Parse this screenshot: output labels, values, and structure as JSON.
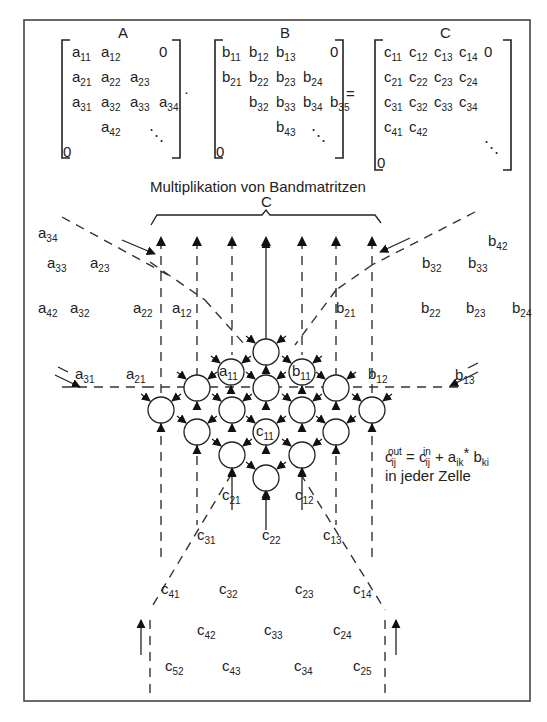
{
  "title": "Multiplikation von Bandmatritzen",
  "brace_label": "C",
  "operators": {
    "multiply": "·",
    "equals": "="
  },
  "matrices": {
    "A": {
      "name": "A",
      "rows": [
        [
          "a11",
          "a12",
          "",
          "0"
        ],
        [
          "a21",
          "a22",
          "a23",
          ""
        ],
        [
          "a31",
          "a32",
          "a33",
          "a34"
        ],
        [
          "",
          "a42",
          "",
          ""
        ]
      ],
      "zero": "0",
      "ellipsis": "⋱"
    },
    "B": {
      "name": "B",
      "rows": [
        [
          "b11",
          "b12",
          "b13",
          "",
          "0"
        ],
        [
          "b21",
          "b22",
          "b23",
          "b24",
          ""
        ],
        [
          "",
          "b32",
          "b33",
          "b34",
          "b35"
        ],
        [
          "",
          "",
          "b43",
          "",
          ""
        ]
      ],
      "zero": "0",
      "ellipsis": "⋱"
    },
    "C": {
      "name": "C",
      "rows": [
        [
          "c11",
          "c12",
          "c13",
          "c14",
          "0"
        ],
        [
          "c21",
          "c22",
          "c23",
          "c24",
          ""
        ],
        [
          "c31",
          "c32",
          "c33",
          "c34",
          ""
        ],
        [
          "c41",
          "c42",
          "",
          "",
          ""
        ]
      ],
      "zero": "0",
      "ellipsis": "⋱"
    }
  },
  "a_inputs": [
    {
      "base": "a",
      "sub": "34"
    },
    {
      "base": "a",
      "sub": "33"
    },
    {
      "base": "a",
      "sub": "23"
    },
    {
      "base": "a",
      "sub": "42"
    },
    {
      "base": "a",
      "sub": "32"
    },
    {
      "base": "a",
      "sub": "22"
    },
    {
      "base": "a",
      "sub": "12"
    },
    {
      "base": "a",
      "sub": "31"
    },
    {
      "base": "a",
      "sub": "21"
    },
    {
      "base": "a",
      "sub": "11"
    }
  ],
  "b_inputs": [
    {
      "base": "b",
      "sub": "42"
    },
    {
      "base": "b",
      "sub": "32"
    },
    {
      "base": "b",
      "sub": "33"
    },
    {
      "base": "b",
      "sub": "21"
    },
    {
      "base": "b",
      "sub": "22"
    },
    {
      "base": "b",
      "sub": "23"
    },
    {
      "base": "b",
      "sub": "24"
    },
    {
      "base": "b",
      "sub": "13"
    },
    {
      "base": "b",
      "sub": "12"
    },
    {
      "base": "b",
      "sub": "11"
    }
  ],
  "c_values": [
    {
      "base": "c",
      "sub": "11"
    },
    {
      "base": "c",
      "sub": "21"
    },
    {
      "base": "c",
      "sub": "12"
    },
    {
      "base": "c",
      "sub": "31"
    },
    {
      "base": "c",
      "sub": "22"
    },
    {
      "base": "c",
      "sub": "13"
    },
    {
      "base": "c",
      "sub": "41"
    },
    {
      "base": "c",
      "sub": "32"
    },
    {
      "base": "c",
      "sub": "23"
    },
    {
      "base": "c",
      "sub": "14"
    },
    {
      "base": "c",
      "sub": "42"
    },
    {
      "base": "c",
      "sub": "33"
    },
    {
      "base": "c",
      "sub": "24"
    },
    {
      "base": "c",
      "sub": "52"
    },
    {
      "base": "c",
      "sub": "43"
    },
    {
      "base": "c",
      "sub": "34"
    },
    {
      "base": "c",
      "sub": "25"
    }
  ],
  "formula": {
    "lhs": "c",
    "lhs_sub": "ij",
    "lhs_sup": "out",
    "eq": " = ",
    "rhs1": "c",
    "rhs1_sub": "ij",
    "rhs1_sup": "in",
    "plus": " + ",
    "a": "a",
    "a_sub": "ik",
    "times": "* ",
    "b": "b",
    "b_sub": "ki",
    "note": "in jeder Zelle"
  }
}
